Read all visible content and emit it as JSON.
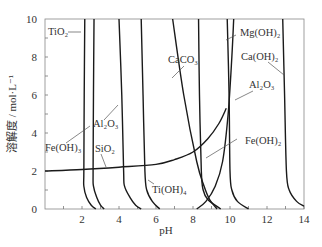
{
  "chart_data": {
    "type": "line",
    "title": "",
    "xlabel": "pH",
    "ylabel": "溶解度 / mol·L⁻¹",
    "xlim": [
      0,
      14
    ],
    "ylim": [
      0,
      10
    ],
    "xticks": [
      2,
      4,
      6,
      8,
      10,
      12,
      14
    ],
    "yticks": [
      0,
      2,
      4,
      6,
      8,
      10
    ],
    "grid": false,
    "series": [
      {
        "name": "TiO2",
        "points": [
          [
            2.15,
            10
          ],
          [
            2.12,
            6
          ],
          [
            2.1,
            2
          ],
          [
            2.1,
            1.2
          ],
          [
            2.25,
            0.6
          ],
          [
            2.5,
            0.2
          ],
          [
            2.75,
            0
          ]
        ]
      },
      {
        "name": "Fe(OH)3",
        "points": [
          [
            2.65,
            10
          ],
          [
            2.62,
            6
          ],
          [
            2.6,
            2
          ],
          [
            2.62,
            1.2
          ],
          [
            2.8,
            0.6
          ],
          [
            3.0,
            0.2
          ],
          [
            3.2,
            0
          ]
        ]
      },
      {
        "name": "Al2O3-acid",
        "points": [
          [
            4.0,
            10
          ],
          [
            4.15,
            6
          ],
          [
            4.25,
            2
          ],
          [
            4.3,
            1.2
          ],
          [
            4.6,
            0.6
          ],
          [
            4.9,
            0.2
          ],
          [
            5.2,
            0
          ]
        ]
      },
      {
        "name": "Ti(OH)4",
        "points": [
          [
            5.2,
            10
          ],
          [
            5.3,
            6
          ],
          [
            5.4,
            2
          ],
          [
            5.5,
            1.0
          ],
          [
            5.8,
            0.4
          ],
          [
            6.2,
            0
          ]
        ]
      },
      {
        "name": "CaCO3",
        "points": [
          [
            6.9,
            10
          ],
          [
            7.5,
            6
          ],
          [
            8.2,
            2.5
          ],
          [
            8.6,
            1.2
          ],
          [
            8.9,
            0.5
          ],
          [
            9.3,
            0
          ]
        ]
      },
      {
        "name": "Fe(OH)2",
        "points": [
          [
            8.3,
            10
          ],
          [
            8.35,
            6
          ],
          [
            8.45,
            2
          ],
          [
            8.55,
            1.0
          ],
          [
            8.8,
            0.5
          ],
          [
            9.5,
            0
          ]
        ]
      },
      {
        "name": "Al2O3-base",
        "points": [
          [
            8.2,
            0
          ],
          [
            8.7,
            0.4
          ],
          [
            9.2,
            1.2
          ],
          [
            9.6,
            2.5
          ],
          [
            9.9,
            5
          ],
          [
            10.1,
            8
          ],
          [
            10.2,
            10
          ]
        ]
      },
      {
        "name": "Mg(OH)2",
        "points": [
          [
            9.85,
            10
          ],
          [
            9.95,
            6
          ],
          [
            10.0,
            2
          ],
          [
            10.1,
            1.0
          ],
          [
            10.4,
            0.4
          ],
          [
            11.0,
            0
          ]
        ]
      },
      {
        "name": "Ca(OH)2",
        "points": [
          [
            12.85,
            10
          ],
          [
            12.95,
            6
          ],
          [
            13.05,
            2
          ],
          [
            13.2,
            1.0
          ],
          [
            13.6,
            0.4
          ],
          [
            14,
            0.15
          ]
        ]
      },
      {
        "name": "SiO2",
        "points": [
          [
            0,
            2.0
          ],
          [
            2,
            2.08
          ],
          [
            4,
            2.2
          ],
          [
            6,
            2.35
          ],
          [
            7,
            2.6
          ],
          [
            8,
            3.0
          ],
          [
            8.8,
            3.7
          ],
          [
            9.4,
            4.5
          ],
          [
            9.8,
            5.3
          ]
        ]
      }
    ],
    "annotations": [
      {
        "text": "TiO₂",
        "series": "TiO2"
      },
      {
        "text": "Al₂O₃",
        "series": "Al2O3-acid"
      },
      {
        "text": "Fe(OH)₃",
        "series": "Fe(OH)3"
      },
      {
        "text": "SiO₂",
        "series": "SiO2"
      },
      {
        "text": "CaCO₃",
        "series": "CaCO3"
      },
      {
        "text": "Ti(OH)₄",
        "series": "Ti(OH)4"
      },
      {
        "text": "Mg(OH)₂",
        "series": "Mg(OH)2"
      },
      {
        "text": "Ca(OH)₂",
        "series": "Ca(OH)2"
      },
      {
        "text": "Al₂O₃",
        "series": "Al2O3-base"
      },
      {
        "text": "Fe(OH)₂",
        "series": "Fe(OH)2"
      }
    ]
  },
  "labels": {
    "xlabel": "pH",
    "ylabel": "溶解度 / mol·L⁻¹",
    "TiO2": "TiO₂",
    "Al2O3_left": "Al₂O₃",
    "FeOH3": "Fe(OH)₃",
    "SiO2": "SiO₂",
    "CaCO3": "CaCO₃",
    "TiOH4": "Ti(OH)₄",
    "MgOH2": "Mg(OH)₂",
    "CaOH2": "Ca(OH)₂",
    "Al2O3_right": "Al₂O₃",
    "FeOH2": "Fe(OH)₂"
  }
}
